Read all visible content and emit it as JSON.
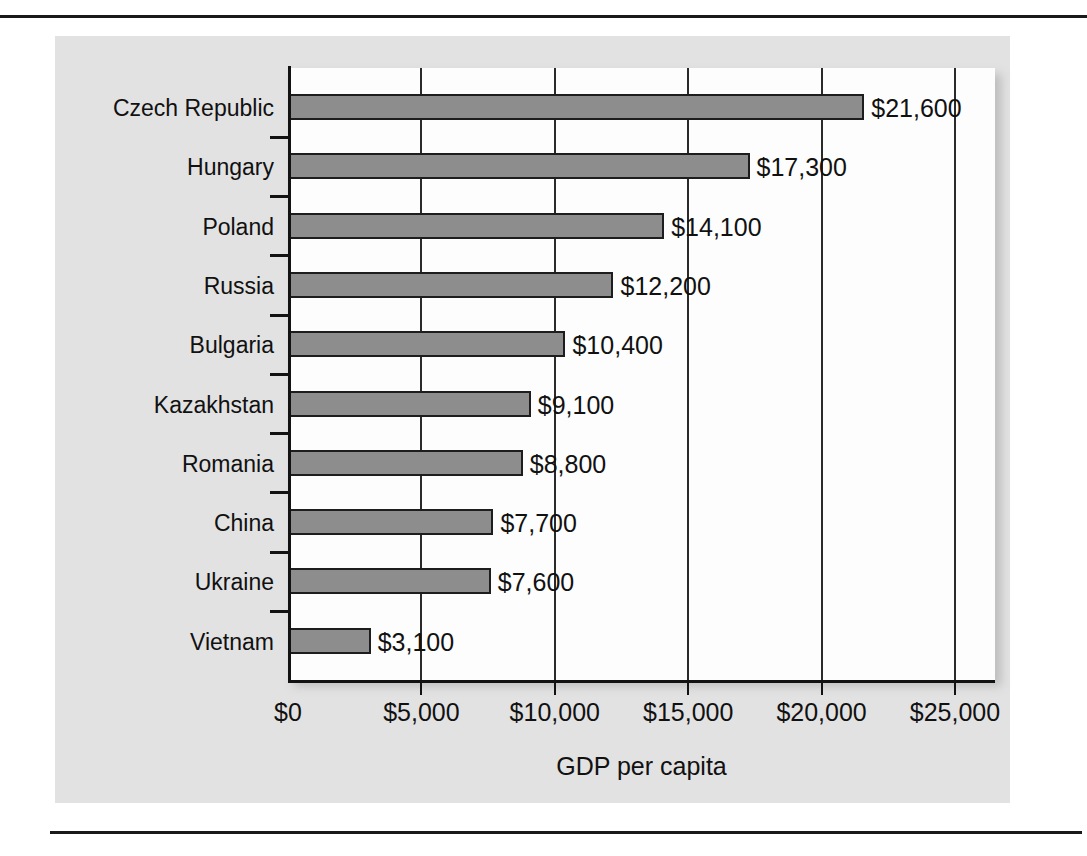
{
  "chart_data": {
    "type": "bar",
    "orientation": "horizontal",
    "title": "",
    "xlabel": "GDP per capita",
    "ylabel": "",
    "xlim": [
      0,
      25000
    ],
    "xticks": [
      0,
      5000,
      10000,
      15000,
      20000,
      25000
    ],
    "xtick_labels": [
      "$0",
      "$5,000",
      "$10,000",
      "$15,000",
      "$20,000",
      "$25,000"
    ],
    "grid": true,
    "legend": null,
    "categories": [
      "Czech Republic",
      "Hungary",
      "Poland",
      "Russia",
      "Bulgaria",
      "Kazakhstan",
      "Romania",
      "China",
      "Ukraine",
      "Vietnam"
    ],
    "values": [
      21600,
      17300,
      14100,
      12200,
      10400,
      9100,
      8800,
      7700,
      7600,
      3100
    ],
    "value_labels": [
      "$21,600",
      "$17,300",
      "$14,100",
      "$12,200",
      "$10,400",
      "$9,100",
      "$8,800",
      "$7,700",
      "$7,600",
      "$3,100"
    ],
    "bars": [
      {
        "category": "Czech Republic",
        "value": 21600,
        "label": "$21,600"
      },
      {
        "category": "Hungary",
        "value": 17300,
        "label": "$17,300"
      },
      {
        "category": "Poland",
        "value": 14100,
        "label": "$14,100"
      },
      {
        "category": "Russia",
        "value": 12200,
        "label": "$12,200"
      },
      {
        "category": "Bulgaria",
        "value": 10400,
        "label": "$10,400"
      },
      {
        "category": "Kazakhstan",
        "value": 9100,
        "label": "$9,100"
      },
      {
        "category": "Romania",
        "value": 8800,
        "label": "$8,800"
      },
      {
        "category": "China",
        "value": 7700,
        "label": "$7,700"
      },
      {
        "category": "Ukraine",
        "value": 7600,
        "label": "$7,600"
      },
      {
        "category": "Vietnam",
        "value": 3100,
        "label": "$3,100"
      }
    ]
  },
  "colors": {
    "bar_fill": "#8d8d8d",
    "bar_stroke": "#1d1d1d",
    "panel_background": "#e2e2e2",
    "plot_background": "#fdfdfd",
    "axis": "#121212",
    "gridline": "#2a2a2a",
    "text": "#111111"
  }
}
